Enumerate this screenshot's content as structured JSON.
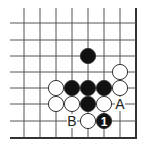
{
  "diagram": {
    "type": "go-board-fragment",
    "grid": {
      "x_lines": [
        24,
        40,
        56,
        72,
        88,
        104,
        120,
        136
      ],
      "y_lines": [
        23,
        40,
        56,
        72,
        88,
        104,
        121,
        138
      ],
      "edge_right": true,
      "edge_bottom": true,
      "line_color": "#555555",
      "edge_color": "#333333"
    },
    "stone_radius": 7.6,
    "stones": [
      {
        "color": "black",
        "col": 4,
        "row": 2,
        "label": ""
      },
      {
        "color": "white",
        "col": 6,
        "row": 3,
        "label": ""
      },
      {
        "color": "white",
        "col": 2,
        "row": 4,
        "label": ""
      },
      {
        "color": "black",
        "col": 3,
        "row": 4,
        "label": ""
      },
      {
        "color": "black",
        "col": 4,
        "row": 4,
        "label": ""
      },
      {
        "color": "black",
        "col": 5,
        "row": 4,
        "label": ""
      },
      {
        "color": "white",
        "col": 6,
        "row": 4,
        "label": ""
      },
      {
        "color": "white",
        "col": 2,
        "row": 5,
        "label": ""
      },
      {
        "color": "white",
        "col": 3,
        "row": 5,
        "label": ""
      },
      {
        "color": "black",
        "col": 4,
        "row": 5,
        "label": ""
      },
      {
        "color": "white",
        "col": 5,
        "row": 5,
        "label": ""
      },
      {
        "color": "white",
        "col": 4,
        "row": 6,
        "label": ""
      },
      {
        "color": "black",
        "col": 5,
        "row": 6,
        "label": "1"
      }
    ],
    "markers": [
      {
        "text": "A",
        "col": 6,
        "row": 5
      },
      {
        "text": "B",
        "col": 3,
        "row": 6
      }
    ],
    "colors": {
      "black_stone": "#111111",
      "white_stone": "#ffffff",
      "stone_outline": "#333333",
      "label_on_black": "#ffffff",
      "marker_text": "#222222"
    }
  }
}
